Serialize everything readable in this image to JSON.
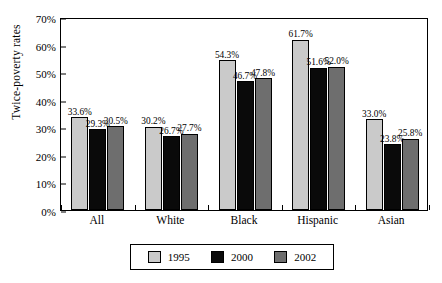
{
  "chart_data": {
    "type": "bar",
    "title": "",
    "xlabel": "",
    "ylabel": "Twice-poverty rates",
    "ylim": [
      0,
      70
    ],
    "ytick_labels": [
      "70%",
      "60%",
      "50%",
      "40%",
      "30%",
      "20%",
      "10%",
      "0%"
    ],
    "ytick_values": [
      70,
      60,
      50,
      40,
      30,
      20,
      10,
      0
    ],
    "grid": false,
    "legend_position": "bottom",
    "categories": [
      "All",
      "White",
      "Black",
      "Hispanic",
      "Asian"
    ],
    "series": [
      {
        "name": "1995",
        "color": "#cacaca",
        "values": [
          33.6,
          30.2,
          54.3,
          61.7,
          33.0
        ],
        "labels": [
          "33.6%",
          "30.2%",
          "54.3%",
          "61.7%",
          "33.0%"
        ]
      },
      {
        "name": "2000",
        "color": "#0a0a0a",
        "values": [
          29.3,
          26.7,
          46.7,
          51.6,
          23.8
        ],
        "labels": [
          "29.3%",
          "26.7%",
          "46.7%",
          "51.6%",
          "23.8%"
        ]
      },
      {
        "name": "2002",
        "color": "#6e6e6e",
        "values": [
          30.5,
          27.7,
          47.8,
          52.0,
          25.8
        ],
        "labels": [
          "30.5%",
          "27.7%",
          "47.8%",
          "52.0%",
          "25.8%"
        ]
      }
    ]
  }
}
